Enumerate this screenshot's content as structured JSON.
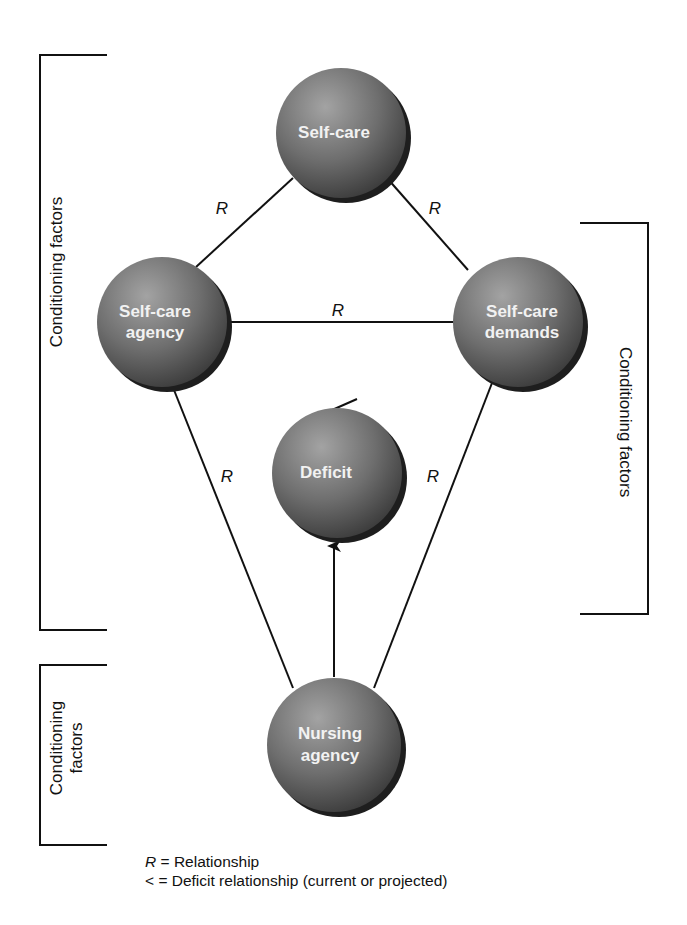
{
  "nodes": {
    "self_care": {
      "line1": "Self-care",
      "line2": ""
    },
    "self_care_agency": {
      "line1": "Self-care",
      "line2": "agency"
    },
    "self_care_demands": {
      "line1": "Self-care",
      "line2": "demands"
    },
    "deficit": {
      "line1": "Deficit",
      "line2": ""
    },
    "nursing_agency": {
      "line1": "Nursing",
      "line2": "agency"
    }
  },
  "relations": {
    "r_top_left": "R",
    "r_top_right": "R",
    "r_middle": "R",
    "r_lower_left": "R",
    "r_lower_right": "R"
  },
  "deficit_symbol": "<",
  "brackets": {
    "left_main": {
      "label": "Conditioning factors"
    },
    "right_main": {
      "label": "Conditioning factors"
    },
    "left_bottom": {
      "line1": "Conditioning",
      "line2": "factors"
    }
  },
  "legend": {
    "items": [
      {
        "symbol": "R",
        "equals": "=",
        "text": "Relationship"
      },
      {
        "symbol": "<",
        "equals": "=",
        "text": "Deficit relationship (current or projected)"
      }
    ]
  },
  "colors": {
    "node_light": "#9a9a9a",
    "node_dark": "#3c3c3c",
    "node_shadow": "#1e1e1e",
    "line": "#111111"
  }
}
